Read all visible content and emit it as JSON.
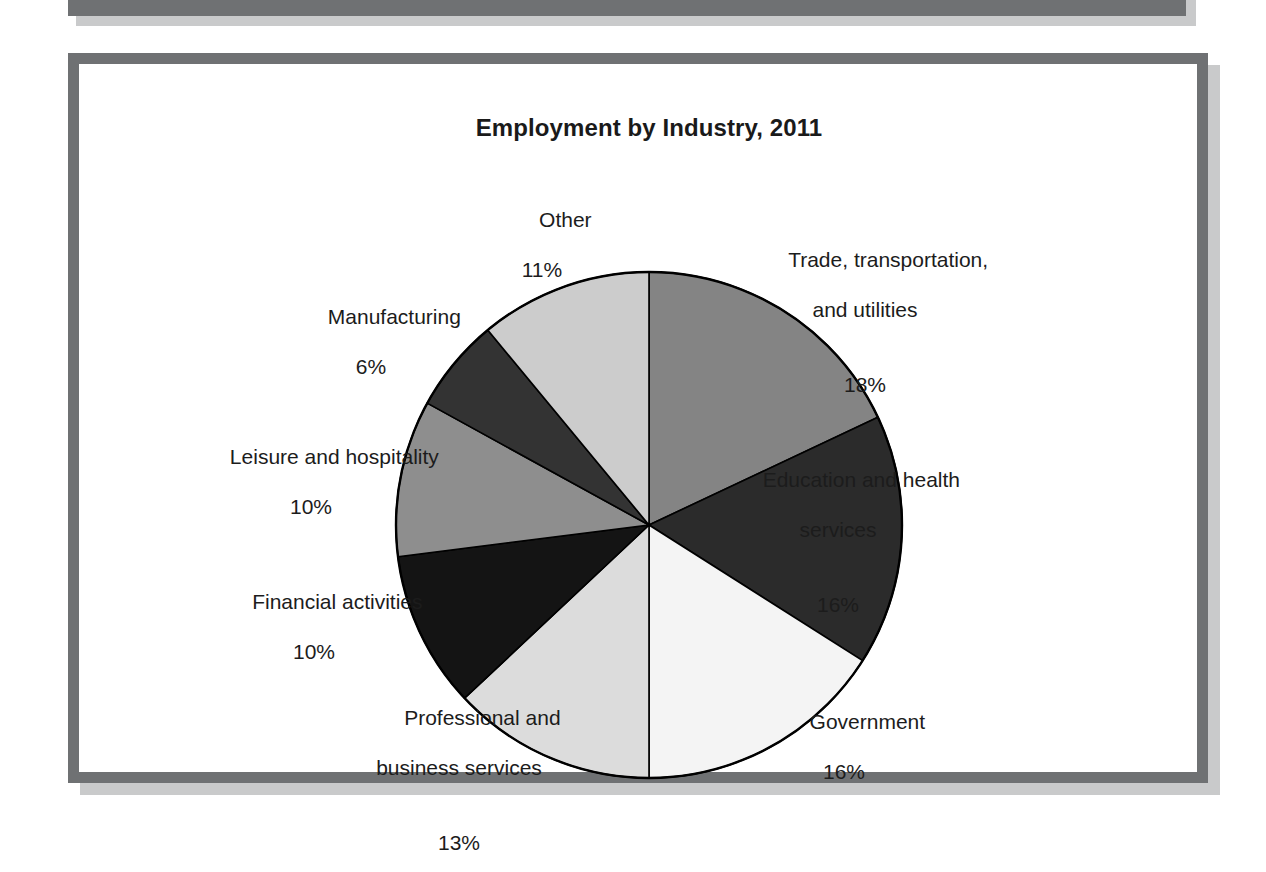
{
  "figure": {
    "title": "Employment by Industry, 2011"
  },
  "chart_data": {
    "type": "pie",
    "title": "Employment by Industry, 2011",
    "xlabel": "",
    "ylabel": "",
    "units": "percent",
    "start_angle_deg": 0,
    "direction": "clockwise",
    "legend": "none",
    "grid": false,
    "categories": [
      "Trade, transportation, and utilities",
      "Education and health services",
      "Government",
      "Professional and business services",
      "Financial activities",
      "Leisure and hospitality",
      "Manufacturing",
      "Other"
    ],
    "values": [
      18,
      16,
      16,
      13,
      10,
      10,
      6,
      11
    ],
    "colors": [
      "#848484",
      "#2b2b2b",
      "#f4f4f4",
      "#dcdcdc",
      "#141414",
      "#8e8e8e",
      "#333333",
      "#cccccc"
    ],
    "slices": [
      {
        "name": "Trade, transportation, and utilities",
        "label_line1": "Trade, transportation,",
        "label_line2": "and utilities",
        "percent_text": "18%",
        "value": 18,
        "color": "#848484"
      },
      {
        "name": "Education and health services",
        "label_line1": "Education and health",
        "label_line2": "services",
        "percent_text": "16%",
        "value": 16,
        "color": "#2b2b2b"
      },
      {
        "name": "Government",
        "label_line1": "Government",
        "label_line2": "",
        "percent_text": "16%",
        "value": 16,
        "color": "#f4f4f4"
      },
      {
        "name": "Professional and business services",
        "label_line1": "Professional and",
        "label_line2": "business services",
        "percent_text": "13%",
        "value": 13,
        "color": "#dcdcdc"
      },
      {
        "name": "Financial activities",
        "label_line1": "Financial activities",
        "label_line2": "",
        "percent_text": "10%",
        "value": 10,
        "color": "#141414"
      },
      {
        "name": "Leisure and hospitality",
        "label_line1": "Leisure and hospitality",
        "label_line2": "",
        "percent_text": "10%",
        "value": 10,
        "color": "#8e8e8e"
      },
      {
        "name": "Manufacturing",
        "label_line1": "Manufacturing",
        "label_line2": "",
        "percent_text": "6%",
        "value": 6,
        "color": "#333333"
      },
      {
        "name": "Other",
        "label_line1": "Other",
        "label_line2": "",
        "percent_text": "11%",
        "value": 11,
        "color": "#cccccc"
      }
    ]
  }
}
